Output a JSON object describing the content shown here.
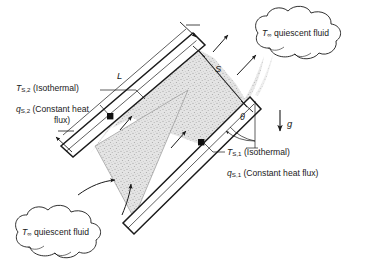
{
  "figure": {
    "type": "engineering-schematic",
    "background_color": "#ffffff",
    "line_color": "#1a1a1a",
    "fluid_fill_color": "#d9d9d9"
  },
  "labels": {
    "upper_plate": {
      "temperature": {
        "symbol": "T",
        "subscript": "S,2",
        "condition": "(Isothermal)"
      },
      "heat_flux": {
        "symbol": "q",
        "subscript": "S,2",
        "condition_line1": "(Constant heat",
        "condition_line2": "flux)"
      }
    },
    "lower_plate": {
      "temperature": {
        "symbol": "T",
        "subscript": "S,1",
        "condition": "(Isothermal)"
      },
      "heat_flux": {
        "symbol": "q",
        "subscript": "S,1",
        "condition": "(Constant heat flux)"
      }
    },
    "plate_length": {
      "symbol": "L"
    },
    "plate_spacing": {
      "symbol": "S"
    },
    "inclination_angle": {
      "symbol": "θ"
    },
    "gravity": {
      "symbol": "g"
    },
    "ambient_top": {
      "symbol": "T",
      "subscript": "∞",
      "text": "quiescent fluid"
    },
    "ambient_bottom": {
      "symbol": "T",
      "subscript": "∞",
      "text": "quiescent fluid"
    }
  },
  "annotations": {
    "marker_count": 2,
    "inflow_arrows": 2,
    "outflow_arrows": 2,
    "internal_flow_arrows": 2
  }
}
